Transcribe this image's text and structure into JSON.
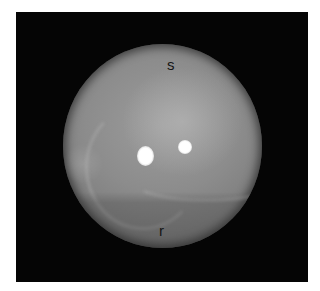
{
  "figure": {
    "labels": {
      "top": "s",
      "bottom": "r"
    },
    "colors": {
      "background": "#050505",
      "disc": "#8c8c8c",
      "highlight": "#ffffff",
      "label": "#151515"
    }
  }
}
